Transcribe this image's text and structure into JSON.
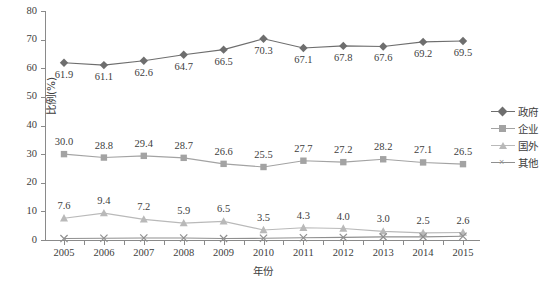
{
  "chart_data": {
    "type": "line",
    "title": "",
    "xlabel": "年份",
    "ylabel": "比例(%)",
    "categories": [
      "2005",
      "2006",
      "2007",
      "2008",
      "2009",
      "2010",
      "2011",
      "2012",
      "2013",
      "2014",
      "2015"
    ],
    "ylim": [
      0,
      80
    ],
    "yticks": [
      0,
      10,
      20,
      30,
      40,
      50,
      60,
      70,
      80
    ],
    "grid": false,
    "legend_position": "right",
    "series": [
      {
        "name": "政府",
        "marker": "diamond",
        "color": "#6e6e6e",
        "label_position": "below",
        "values": [
          61.9,
          61.1,
          62.6,
          64.7,
          66.5,
          70.3,
          67.1,
          67.8,
          67.6,
          69.2,
          69.5
        ],
        "labels": [
          "61.9",
          "61.1",
          "62.6",
          "64.7",
          "66.5",
          "70.3",
          "67.1",
          "67.8",
          "67.6",
          "69.2",
          "69.5"
        ]
      },
      {
        "name": "企业",
        "marker": "square",
        "color": "#a3a3a3",
        "label_position": "above",
        "values": [
          30.0,
          28.8,
          29.4,
          28.7,
          26.6,
          25.5,
          27.7,
          27.2,
          28.2,
          27.1,
          26.5
        ],
        "labels": [
          "30.0",
          "28.8",
          "29.4",
          "28.7",
          "26.6",
          "25.5",
          "27.7",
          "27.2",
          "28.2",
          "27.1",
          "26.5"
        ]
      },
      {
        "name": "国外",
        "marker": "triangle",
        "color": "#b9b9b9",
        "label_position": "above",
        "values": [
          7.6,
          9.4,
          7.2,
          5.9,
          6.5,
          3.5,
          4.3,
          4.0,
          3.0,
          2.5,
          2.6
        ],
        "labels": [
          "7.6",
          "9.4",
          "7.2",
          "5.9",
          "6.5",
          "3.5",
          "4.3",
          "4.0",
          "3.0",
          "2.5",
          "2.6"
        ]
      },
      {
        "name": "其他",
        "marker": "x",
        "color": "#8f8f8f",
        "label_position": "none",
        "values": [
          0.5,
          0.6,
          0.7,
          0.7,
          0.5,
          0.6,
          0.8,
          0.9,
          1.1,
          1.1,
          1.3
        ],
        "labels": [
          "",
          "",
          "",
          "",
          "",
          "",
          "",
          "",
          "",
          "",
          ""
        ]
      }
    ]
  },
  "legend": {
    "items": [
      {
        "label": "政府"
      },
      {
        "label": "企业"
      },
      {
        "label": "国外"
      },
      {
        "label": "其他"
      }
    ]
  },
  "caption": {
    "text": ""
  }
}
